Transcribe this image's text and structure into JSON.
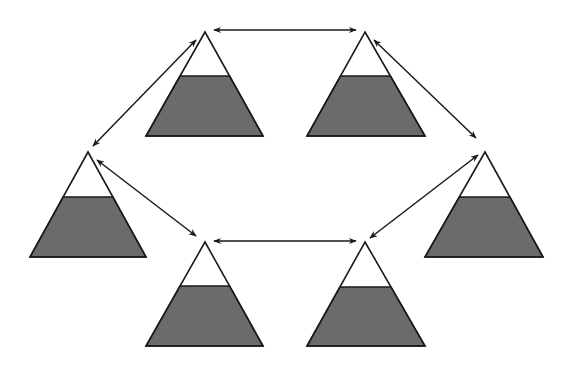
{
  "diagram": {
    "type": "network-of-filled-triangles",
    "colors": {
      "fill": "#6b6b6b",
      "outline": "#1a1a1a",
      "background": "#ffffff",
      "arrow": "#1a1a1a"
    },
    "nodes": [
      {
        "id": "top-left",
        "apex": [
          205,
          32
        ],
        "base_y": 136,
        "base_left": 146,
        "base_right": 263,
        "fill_y": 76
      },
      {
        "id": "top-right",
        "apex": [
          365,
          32
        ],
        "base_y": 136,
        "base_left": 307,
        "base_right": 425,
        "fill_y": 76
      },
      {
        "id": "middle-left",
        "apex": [
          88,
          152
        ],
        "base_y": 257,
        "base_left": 30,
        "base_right": 146,
        "fill_y": 197
      },
      {
        "id": "middle-right",
        "apex": [
          485,
          152
        ],
        "base_y": 257,
        "base_left": 425,
        "base_right": 543,
        "fill_y": 197
      },
      {
        "id": "bottom-left",
        "apex": [
          205,
          242
        ],
        "base_y": 346,
        "base_left": 146,
        "base_right": 263,
        "fill_y": 286
      },
      {
        "id": "bottom-right",
        "apex": [
          365,
          242
        ],
        "base_y": 346,
        "base_left": 307,
        "base_right": 425,
        "fill_y": 287
      }
    ],
    "edges": [
      {
        "from": "top-left",
        "to": "top-right",
        "x1": 214,
        "y1": 30,
        "x2": 356,
        "y2": 30,
        "bidirectional": true
      },
      {
        "from": "top-left",
        "to": "middle-left",
        "x1": 196,
        "y1": 40,
        "x2": 93,
        "y2": 146,
        "bidirectional": true
      },
      {
        "from": "top-right",
        "to": "middle-right",
        "x1": 374,
        "y1": 40,
        "x2": 476,
        "y2": 138,
        "bidirectional": true
      },
      {
        "from": "middle-left",
        "to": "bottom-left",
        "x1": 97,
        "y1": 160,
        "x2": 196,
        "y2": 236,
        "bidirectional": true
      },
      {
        "from": "middle-right",
        "to": "bottom-right",
        "x1": 478,
        "y1": 155,
        "x2": 370,
        "y2": 238,
        "bidirectional": true
      },
      {
        "from": "bottom-left",
        "to": "bottom-right",
        "x1": 214,
        "y1": 241,
        "x2": 356,
        "y2": 241,
        "bidirectional": true
      }
    ]
  }
}
